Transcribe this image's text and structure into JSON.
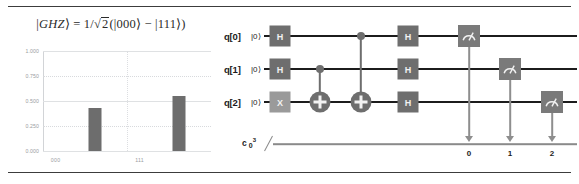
{
  "figure": {
    "top_rule": "divider",
    "bottom_rule": "divider"
  },
  "histogram": {
    "title_plain": "|GHZ⟩ = 1/√2(|000⟩ − |111⟩)",
    "title_parts": {
      "ket_open": "|",
      "state_name": "GHZ",
      "ket_close": "⟩",
      "equals": "=",
      "coefficient": "1/",
      "radical": "√",
      "radicand": "2",
      "lparen": "(",
      "ket_000": "|000⟩",
      "minus": "−",
      "ket_111": "|111⟩",
      "rparen": ")"
    }
  },
  "chart_data": {
    "type": "bar",
    "title": "|GHZ⟩ = 1/√2(|000⟩ − |111⟩)",
    "xlabel": "",
    "ylabel": "",
    "categories": [
      "000",
      "111"
    ],
    "values": [
      0.43,
      0.55
    ],
    "ylim": [
      0.0,
      1.0
    ],
    "ytick_labels": [
      "0.000",
      "0.250",
      "0.500",
      "0.750",
      "1.000"
    ],
    "ytick_values": [
      0.0,
      0.25,
      0.5,
      0.75,
      1.0
    ],
    "xtick_labels": [
      "000",
      "111"
    ],
    "grid": true,
    "legend": "none",
    "bar_color": "#6d6d6d"
  },
  "circuit": {
    "qubits": [
      {
        "label": "q[0]",
        "state": "|0⟩"
      },
      {
        "label": "q[1]",
        "state": "|0⟩"
      },
      {
        "label": "q[2]",
        "state": "|0⟩"
      }
    ],
    "classical_register": {
      "name": "c",
      "index": "0",
      "width": "3"
    },
    "gates": {
      "h": "H",
      "x": "X",
      "measure": "measure-icon",
      "cnot": "cnot-target-icon",
      "control": "control-dot-icon"
    },
    "classical_bits": [
      "0",
      "1",
      "2"
    ],
    "colors": {
      "h_gate": "#6e6e6e",
      "x_gate": "#9a9a9a",
      "measure_gate": "#7a7a7a",
      "wire": "#1c1c1c",
      "classical_wire": "#8a8a8a"
    }
  }
}
